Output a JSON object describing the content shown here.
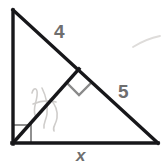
{
  "figure": {
    "background_color": "#ffffff",
    "stroke_color": "#17171a",
    "marker_color": "#8c8c8c",
    "label_color": "#6e6e6e",
    "pencil_color": "#c8c6c4",
    "labels": {
      "upper_hypotenuse_segment": "4",
      "lower_hypotenuse_segment": "5",
      "base_unknown": "x"
    },
    "markers": {
      "vertex_right_angle": "right-angle-square",
      "altitude_foot_right_angle": "right-angle-square"
    },
    "vertices": {
      "apex": "13,10",
      "bottom_left": "13,143",
      "bottom_right": "158,143",
      "altitude_foot": "78,70"
    }
  }
}
